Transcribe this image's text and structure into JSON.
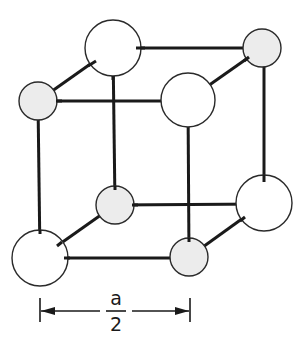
{
  "figure": {
    "atoms": [
      {
        "id": "top-back-left",
        "type": "large",
        "cx": 113,
        "cy": 48,
        "r": 28
      },
      {
        "id": "top-back-right",
        "type": "small",
        "cx": 262,
        "cy": 48,
        "r": 19
      },
      {
        "id": "top-front-left",
        "type": "small",
        "cx": 38,
        "cy": 101,
        "r": 19
      },
      {
        "id": "top-front-right",
        "type": "large",
        "cx": 188,
        "cy": 100,
        "r": 27
      },
      {
        "id": "bottom-back-left",
        "type": "small",
        "cx": 115,
        "cy": 205,
        "r": 19
      },
      {
        "id": "bottom-back-right",
        "type": "large",
        "cx": 264,
        "cy": 203,
        "r": 28
      },
      {
        "id": "bottom-front-left",
        "type": "large",
        "cx": 40,
        "cy": 258,
        "r": 28
      },
      {
        "id": "bottom-front-right",
        "type": "small",
        "cx": 189,
        "cy": 257,
        "r": 19
      }
    ],
    "colors": {
      "large_atom_fill": "#ffffff",
      "small_atom_fill": "#ececec",
      "line": "#1a1a1a"
    }
  },
  "dimension": {
    "numerator": "a",
    "denominator": "2"
  }
}
